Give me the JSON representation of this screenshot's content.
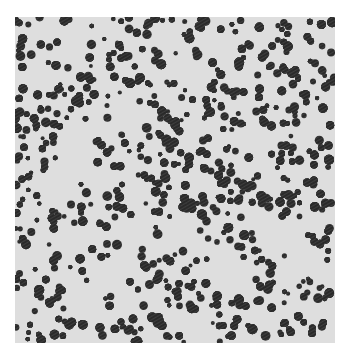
{
  "image": {
    "subject": "particle aggregate micrograph",
    "background_color": "#ffffff",
    "light_region_color": "#dcdcdc",
    "dark_region_color": "#2a2a2a",
    "frame": {
      "x": 15,
      "y": 17,
      "width": 320,
      "height": 326
    }
  }
}
